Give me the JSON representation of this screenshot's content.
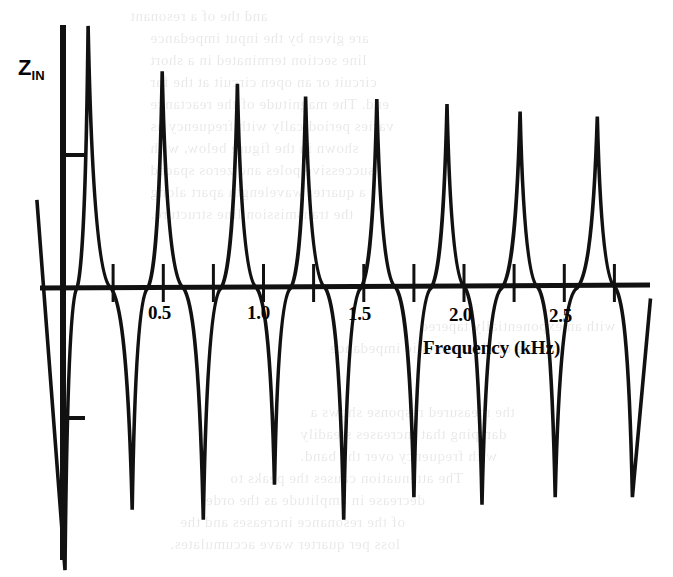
{
  "figure": {
    "background_color": "#ffffff",
    "ink_color": "#111111",
    "y_axis_label": "Z",
    "y_axis_label_sub": "IN",
    "x_axis_title": "Frequency (kHz)"
  },
  "bleed_through_text": [
    {
      "text": "and  the  of  a  resonant",
      "x": 130,
      "y": 8
    },
    {
      "text": "are  given  by  the  input  impedance",
      "x": 150,
      "y": 30
    },
    {
      "text": "line  section  terminated  in  a  short",
      "x": 150,
      "y": 52
    },
    {
      "text": "circuit  or  an  open  circuit  at  the  far",
      "x": 150,
      "y": 74
    },
    {
      "text": "end.  The  magnitude  of  the  reactance",
      "x": 150,
      "y": 96
    },
    {
      "text": "varies  periodically  with  frequency  as",
      "x": 150,
      "y": 118
    },
    {
      "text": "shown  in  the  figure  below,  with",
      "x": 150,
      "y": 140
    },
    {
      "text": "successive  poles  and  zeros  spaced",
      "x": 150,
      "y": 162
    },
    {
      "text": "a  quarter  wavelength  apart  along",
      "x": 150,
      "y": 184
    },
    {
      "text": "the  transmission  line  structure.",
      "x": 150,
      "y": 206
    },
    {
      "text": "with  an  exponentially  tapered",
      "x": 420,
      "y": 318
    },
    {
      "text": "profile  of  characteristic  impedance",
      "x": 330,
      "y": 340
    },
    {
      "text": "the  measured  response  shows  a",
      "x": 310,
      "y": 404
    },
    {
      "text": "damping  that  increases  steadily",
      "x": 300,
      "y": 426
    },
    {
      "text": "with  frequency  over  the  band.",
      "x": 300,
      "y": 448
    },
    {
      "text": "The  attenuation  causes  the  peaks  to",
      "x": 230,
      "y": 470
    },
    {
      "text": "decrease  in  amplitude  as  the  order",
      "x": 200,
      "y": 492
    },
    {
      "text": "of  the  resonance  increases  and  the",
      "x": 180,
      "y": 514
    },
    {
      "text": "loss  per  quarter  wave  accumulates.",
      "x": 170,
      "y": 536
    }
  ],
  "axes": {
    "origin_px": {
      "x": 63,
      "y": 288
    },
    "x_axis_end_px": 650,
    "y_axis_top_px": 25,
    "y_axis_bottom_px": 560,
    "y_ticks_px": [
      155,
      418
    ],
    "x_tick_spacing_px": 40,
    "px_per_khz": 200.5
  },
  "chart_data": {
    "type": "line",
    "title": "",
    "xlabel": "Frequency (kHz)",
    "ylabel": "Z_IN",
    "xlim": [
      0,
      2.93
    ],
    "ylim": [
      -1.25,
      1.32
    ],
    "grid": false,
    "legend": false,
    "x_tick_values": [
      0.25,
      0.5,
      0.75,
      1.0,
      1.25,
      1.5,
      1.75,
      2.0,
      2.25,
      2.5,
      2.75
    ],
    "x_tick_labels": [
      "",
      "0.5",
      "",
      "1.0",
      "",
      "1.5",
      "",
      "2.0",
      "",
      "2.5",
      ""
    ],
    "y_tick_values": [
      -0.5,
      0.5
    ],
    "y_tick_labels": [
      "",
      ""
    ],
    "resonance_peaks": [
      {
        "freq_khz": 0.125,
        "value": 1.04
      },
      {
        "freq_khz": 0.495,
        "value": 0.86
      },
      {
        "freq_khz": 0.87,
        "value": 0.81
      },
      {
        "freq_khz": 1.21,
        "value": 0.76
      },
      {
        "freq_khz": 1.565,
        "value": 0.75
      },
      {
        "freq_khz": 1.915,
        "value": 0.73
      },
      {
        "freq_khz": 2.28,
        "value": 0.7
      },
      {
        "freq_khz": 2.665,
        "value": 0.68
      }
    ],
    "antiresonance_troughs": [
      {
        "freq_khz": 0.01,
        "value": -1.12
      },
      {
        "freq_khz": 0.345,
        "value": -0.88
      },
      {
        "freq_khz": 0.7,
        "value": -0.92
      },
      {
        "freq_khz": 1.055,
        "value": -0.78
      },
      {
        "freq_khz": 1.4,
        "value": -0.92
      },
      {
        "freq_khz": 1.75,
        "value": -0.83
      },
      {
        "freq_khz": 2.09,
        "value": -0.86
      },
      {
        "freq_khz": 2.455,
        "value": -0.83
      },
      {
        "freq_khz": 2.84,
        "value": -0.83
      }
    ]
  }
}
